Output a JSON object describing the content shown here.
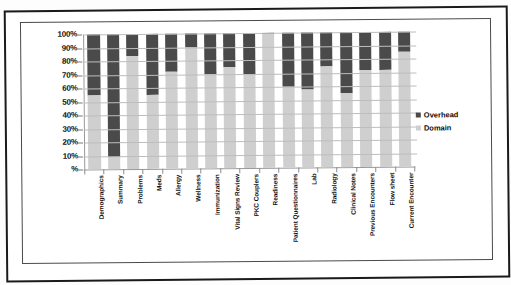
{
  "chart_data": {
    "type": "bar",
    "subtype": "stacked-percent",
    "title": "",
    "xlabel": "",
    "ylabel": "",
    "ylim": [
      0,
      100
    ],
    "ytick_labels": [
      "100%",
      "90%",
      "80%",
      "70%",
      "60%",
      "50%",
      "40%",
      "30%",
      "20%",
      "10%",
      "%"
    ],
    "ytick_values": [
      100,
      90,
      80,
      70,
      60,
      50,
      40,
      30,
      20,
      10,
      0
    ],
    "grid": true,
    "legend_position": "right",
    "categories": [
      "Demographics",
      "Summary",
      "Problems",
      "Meds",
      "Allergy",
      "Wellness",
      "Immunization",
      "Vital Signs Review",
      "PKC Couplers",
      "Readiness",
      "Patient Questionnaires",
      "Lab",
      "Radiology",
      "Clinical Notes",
      "Previous Encounters",
      "Flow sheet",
      "Current Encounter"
    ],
    "series": [
      {
        "name": "Domain",
        "color": "#cfcfcf",
        "values": [
          55,
          9,
          84,
          55,
          72,
          90,
          70,
          75,
          70,
          99,
          60,
          58,
          75,
          55,
          72,
          72,
          85
        ]
      },
      {
        "name": "Overhead",
        "color": "#4a4a4a",
        "values": [
          45,
          91,
          16,
          45,
          28,
          10,
          30,
          25,
          30,
          1,
          40,
          42,
          25,
          45,
          28,
          28,
          15
        ]
      }
    ]
  },
  "legend": {
    "items": [
      {
        "label": "Overhead",
        "color": "#4a4a4a"
      },
      {
        "label": "Domain",
        "color": "#cfcfcf"
      }
    ]
  }
}
